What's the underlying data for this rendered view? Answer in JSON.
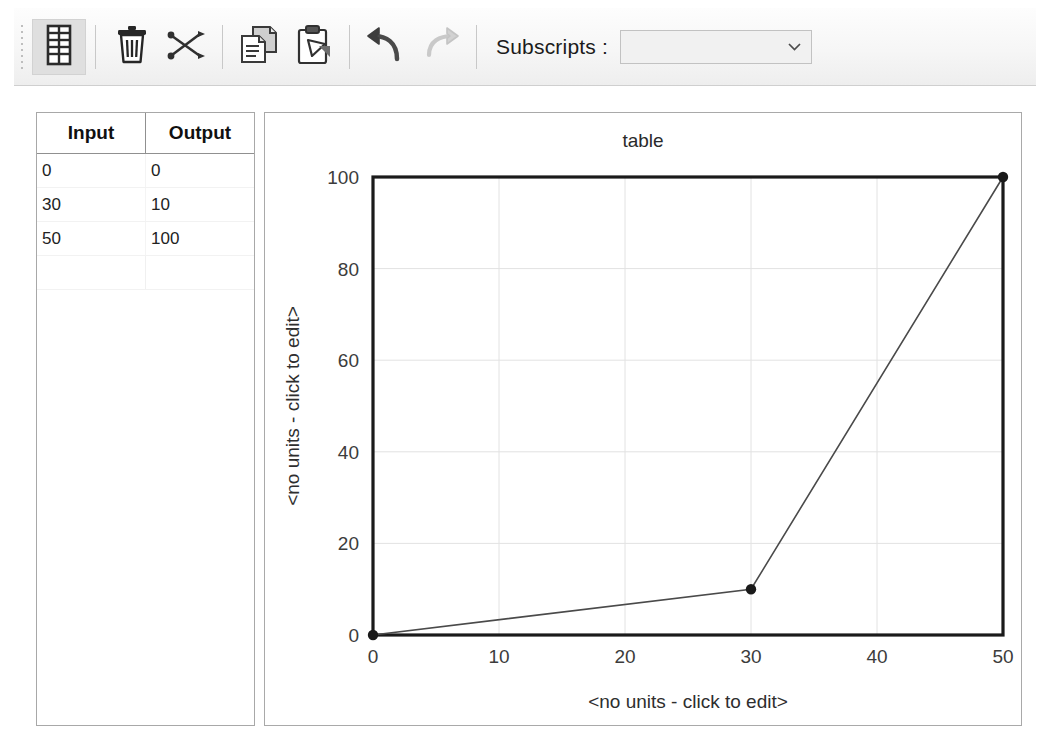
{
  "toolbar": {
    "grip_name": "toolbar-drag-grip",
    "buttons": [
      {
        "name": "table-view-button",
        "icon": "table-icon",
        "pressed": true,
        "enabled": true
      },
      {
        "name": "delete-button",
        "icon": "trash-icon",
        "pressed": false,
        "enabled": true
      },
      {
        "name": "cut-button",
        "icon": "scissors-icon",
        "pressed": false,
        "enabled": true
      },
      {
        "name": "copy-button",
        "icon": "copy-icon",
        "pressed": false,
        "enabled": true
      },
      {
        "name": "paste-button",
        "icon": "paste-icon",
        "pressed": false,
        "enabled": true
      },
      {
        "name": "undo-button",
        "icon": "undo-arrow-icon",
        "pressed": false,
        "enabled": true
      },
      {
        "name": "redo-button",
        "icon": "redo-arrow-icon",
        "pressed": false,
        "enabled": false
      }
    ],
    "subscripts_label": "Subscripts :",
    "subscripts_value": "",
    "subscripts_placeholder": ""
  },
  "table": {
    "columns": [
      "Input",
      "Output"
    ],
    "rows": [
      [
        "0",
        "0"
      ],
      [
        "30",
        "10"
      ],
      [
        "50",
        "100"
      ],
      [
        "",
        ""
      ]
    ]
  },
  "chart_data": {
    "type": "line",
    "title": "table",
    "xlabel": "<no units - click to edit>",
    "ylabel": "<no units - click to edit>",
    "x": [
      0,
      30,
      50
    ],
    "values": [
      0,
      10,
      100
    ],
    "xlim": [
      0,
      50
    ],
    "ylim": [
      0,
      100
    ],
    "xticks": [
      "0",
      "10",
      "20",
      "30",
      "40",
      "50"
    ],
    "yticks": [
      "0",
      "20",
      "40",
      "60",
      "80",
      "100"
    ],
    "grid": true,
    "legend": "none",
    "line_color": "#4a4a4a",
    "marker_color": "#1a1a1a",
    "axis_color": "#1a1a1a",
    "grid_color": "#e2e2e2"
  }
}
